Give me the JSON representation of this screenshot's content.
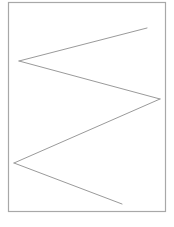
{
  "diagram": {
    "frame_color": "#a8a8a8",
    "line_color": "#9a9a9a",
    "polyline_vertices_count": 5
  }
}
